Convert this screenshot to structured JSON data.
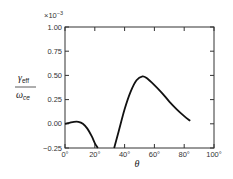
{
  "chart_data": {
    "type": "line",
    "title": "",
    "xlabel": "θ",
    "ylabel_numerator": "γ",
    "ylabel_numerator_sub": "eff",
    "ylabel_denominator": "ω",
    "ylabel_denominator_sub": "ce",
    "y_multiplier": "×10",
    "y_multiplier_exp": "−3",
    "xlim": [
      0,
      100
    ],
    "ylim": [
      -0.25,
      1.0
    ],
    "x_ticks": [
      "0°",
      "20°",
      "40°",
      "60°",
      "80°",
      "100°"
    ],
    "y_ticks": [
      "-0.25",
      "0.00",
      "0.25",
      "0.50",
      "0.75",
      "1.00"
    ],
    "grid": false,
    "series": [
      {
        "name": "segment-1",
        "x": [
          0,
          3,
          6,
          9,
          12,
          15,
          18,
          20,
          22
        ],
        "y": [
          0.0,
          0.01,
          0.02,
          0.02,
          0.0,
          -0.05,
          -0.13,
          -0.2,
          -0.25
        ]
      },
      {
        "name": "segment-2",
        "x": [
          33,
          36,
          40,
          44,
          48,
          52,
          55,
          60,
          65,
          70,
          75,
          80,
          84
        ],
        "y": [
          -0.25,
          -0.08,
          0.15,
          0.33,
          0.45,
          0.49,
          0.47,
          0.4,
          0.32,
          0.23,
          0.15,
          0.08,
          0.03
        ]
      }
    ]
  }
}
